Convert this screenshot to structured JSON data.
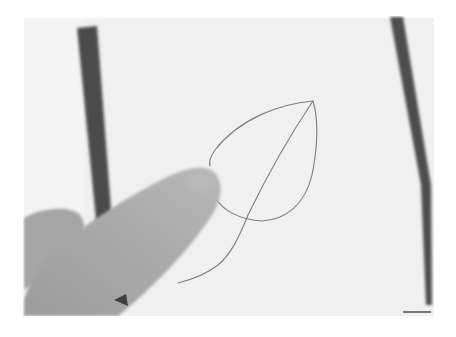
{
  "image": {
    "description": "Grayscale photo of a finger touching a sheet of paper with a hand-drawn leaf outline",
    "colors": {
      "background": "#ffffff",
      "paper": "#f1f1f1",
      "frame_strip": "#4a4a4a",
      "leaf_line": "#7a7a7a",
      "finger": "#a9a9a9",
      "finger_shadow": "#8f8f8f"
    }
  }
}
